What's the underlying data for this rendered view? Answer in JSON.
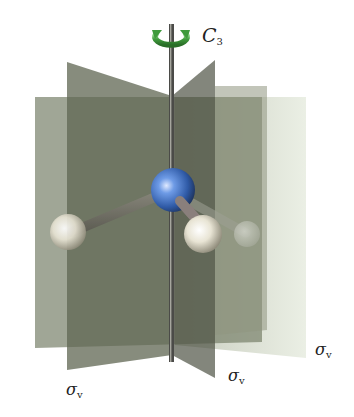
{
  "figure": {
    "axis_label": {
      "symbol": "C",
      "subscript": "3"
    },
    "plane_labels": [
      {
        "symbol": "σ",
        "subscript": "v"
      },
      {
        "symbol": "σ",
        "subscript": "v"
      },
      {
        "symbol": "σ",
        "subscript": "v"
      }
    ],
    "colors": {
      "rotation_arrow": "#3f9a3c",
      "central_atom": "#3d6fc4",
      "outer_atoms": "#e8e4d6",
      "planes": "#5d6350",
      "axis": "#4a4a4a"
    }
  }
}
